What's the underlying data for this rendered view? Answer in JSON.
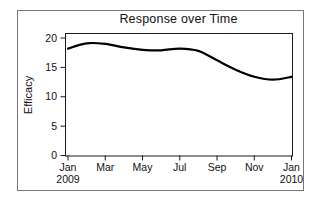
{
  "figure": {
    "title": "Response over Time",
    "y_axis_title": "Efficacy"
  },
  "chart_data": {
    "type": "line",
    "title": "Response over Time",
    "xlabel": "",
    "ylabel": "Efficacy",
    "x": [
      "Jan 2009",
      "Feb 2009",
      "Mar 2009",
      "Apr 2009",
      "May 2009",
      "Jun 2009",
      "Jul 2009",
      "Aug 2009",
      "Sep 2009",
      "Oct 2009",
      "Nov 2009",
      "Dec 2009",
      "Jan 2010"
    ],
    "values": [
      18.2,
      19.1,
      19.0,
      18.4,
      18.0,
      17.9,
      18.2,
      17.8,
      16.2,
      14.6,
      13.4,
      12.9,
      13.4
    ],
    "ylim": [
      0,
      20
    ],
    "yticks": [
      0,
      5,
      10,
      15,
      20
    ],
    "xticks": [
      {
        "month_index": 0,
        "label": "Jan",
        "sublabel": "2009"
      },
      {
        "month_index": 2,
        "label": "Mar",
        "sublabel": ""
      },
      {
        "month_index": 4,
        "label": "May",
        "sublabel": ""
      },
      {
        "month_index": 6,
        "label": "Jul",
        "sublabel": ""
      },
      {
        "month_index": 8,
        "label": "Sep",
        "sublabel": ""
      },
      {
        "month_index": 10,
        "label": "Nov",
        "sublabel": ""
      },
      {
        "month_index": 12,
        "label": "Jan",
        "sublabel": "2010"
      }
    ],
    "grid": false,
    "legend_position": "none",
    "line_color": "#000000",
    "frame_color": "#1a1a1a",
    "outer_border_color": "#777777",
    "smooth": true
  }
}
